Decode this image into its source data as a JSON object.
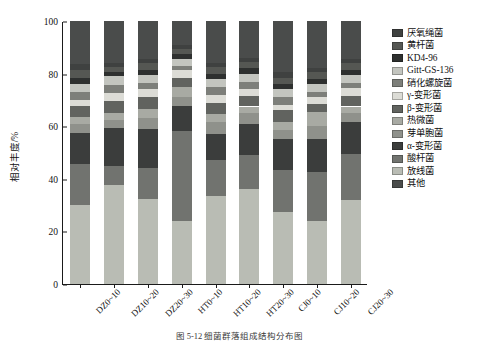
{
  "chart_data": {
    "type": "bar",
    "subtype": "stacked-percentage",
    "title": "",
    "xlabel": "",
    "ylabel": "相对丰度/%",
    "ylim": [
      0,
      100
    ],
    "yticks": [
      0,
      20,
      40,
      60,
      80,
      100
    ],
    "grid": false,
    "legend_position": "right",
    "categories": [
      "DZ0~10",
      "DZ10~20",
      "DZ20~30",
      "HT0~10",
      "HT10~20",
      "HT20~30",
      "CJ0~10",
      "CJ10~20",
      "CJ20~30"
    ],
    "series": [
      {
        "name": "放线菌",
        "color": "#b9bcb4",
        "values": [
          30.0,
          37.5,
          32.5,
          24.0,
          33.5,
          36.0,
          27.5,
          24.0,
          32.0
        ]
      },
      {
        "name": "酸杆菌",
        "color": "#71736f",
        "values": [
          15.5,
          7.5,
          11.5,
          34.0,
          13.5,
          13.0,
          16.0,
          18.5,
          17.5
        ]
      },
      {
        "name": "α-变形菌",
        "color": "#3b3d3c",
        "values": [
          12.0,
          14.5,
          15.0,
          9.5,
          10.0,
          12.0,
          11.5,
          12.5,
          12.0
        ]
      },
      {
        "name": "芽单胞菌",
        "color": "#8f918b",
        "values": [
          3.5,
          3.0,
          4.0,
          3.5,
          4.5,
          4.0,
          3.5,
          5.0,
          3.5
        ]
      },
      {
        "name": "热微菌",
        "color": "#a8aaa3",
        "values": [
          2.5,
          2.5,
          3.5,
          4.0,
          3.0,
          2.5,
          3.0,
          5.5,
          2.5
        ]
      },
      {
        "name": "β-变形菌",
        "color": "#61635f",
        "values": [
          4.0,
          4.5,
          4.5,
          3.5,
          4.5,
          4.0,
          4.5,
          3.0,
          4.0
        ]
      },
      {
        "name": "γ-变形菌",
        "color": "#dcdcd6",
        "values": [
          2.5,
          3.0,
          3.0,
          3.0,
          3.0,
          2.5,
          2.0,
          2.5,
          3.0
        ]
      },
      {
        "name": "硝化螺旋菌",
        "color": "#7d7f7a",
        "values": [
          3.0,
          3.0,
          2.5,
          1.5,
          3.0,
          3.0,
          3.0,
          2.0,
          2.0
        ]
      },
      {
        "name": "Gitt-GS-136",
        "color": "#c3c5bf",
        "values": [
          3.0,
          3.5,
          3.0,
          2.5,
          3.0,
          3.0,
          3.0,
          3.0,
          3.0
        ]
      },
      {
        "name": "KD4-96",
        "color": "#2e302f",
        "values": [
          2.5,
          1.5,
          2.0,
          2.0,
          2.0,
          2.0,
          2.0,
          2.0,
          2.0
        ]
      },
      {
        "name": "黄杆菌",
        "color": "#555753",
        "values": [
          3.0,
          2.0,
          2.5,
          2.0,
          2.5,
          2.5,
          2.5,
          2.5,
          2.5
        ]
      },
      {
        "name": "厌氧绳菌",
        "color": "#3f4140",
        "values": [
          2.0,
          1.5,
          1.5,
          1.5,
          1.5,
          1.5,
          2.0,
          1.5,
          1.5
        ]
      },
      {
        "name": "其他",
        "color": "#4a4c4b",
        "values": [
          16.5,
          16.0,
          14.5,
          9.0,
          16.0,
          14.0,
          19.5,
          18.0,
          14.5
        ]
      }
    ],
    "legend_entries": [
      {
        "label": "厌氧绳菌",
        "color": "#3f4140"
      },
      {
        "label": "黄杆菌",
        "color": "#555753"
      },
      {
        "label": "KD4-96",
        "color": "#2e302f"
      },
      {
        "label": "Gitt-GS-136",
        "color": "#c3c5bf"
      },
      {
        "label": "硝化螺旋菌",
        "color": "#7d7f7a"
      },
      {
        "label": "γ-变形菌",
        "color": "#dcdcd6"
      },
      {
        "label": "β-变形菌",
        "color": "#61635f"
      },
      {
        "label": "热微菌",
        "color": "#a8aaa3"
      },
      {
        "label": "芽单胞菌",
        "color": "#8f918b"
      },
      {
        "label": "α-变形菌",
        "color": "#3b3d3c"
      },
      {
        "label": "酸杆菌",
        "color": "#71736f"
      },
      {
        "label": "放线菌",
        "color": "#b9bcb4"
      },
      {
        "label": "其他",
        "color": "#4a4c4b"
      }
    ]
  },
  "caption": "图 5-12   细菌群落组成结构分布图"
}
